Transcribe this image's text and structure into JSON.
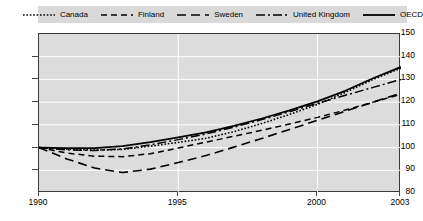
{
  "chart_data": {
    "type": "line",
    "title": "",
    "subtitle": "",
    "xlabel": "",
    "ylabel": "",
    "xlim": [
      1990,
      2003
    ],
    "ylim": [
      80,
      150
    ],
    "yticks": [
      80,
      90,
      100,
      110,
      120,
      130,
      140,
      150
    ],
    "xticks": [
      1990,
      1995,
      2000,
      2003
    ],
    "grid": true,
    "grid_color": "#ffffff",
    "plot_background": "#dcdcdc",
    "legend_position": "top",
    "legend_background": "#d9d9d9",
    "line_color": "#000000",
    "x": [
      1990,
      1991,
      1992,
      1993,
      1994,
      1995,
      1996,
      1997,
      1998,
      1999,
      2000,
      2001,
      2002,
      2003
    ],
    "series": [
      {
        "name": "Canada",
        "dash": "dotted",
        "dash_pattern": "1.6,1.8",
        "width": 1.6,
        "values": [
          100.0,
          99.3,
          98.9,
          99.2,
          100.6,
          102.3,
          104.1,
          107.0,
          110.6,
          114.6,
          119.0,
          124.3,
          130.0,
          135.0
        ]
      },
      {
        "name": "Finland",
        "dash": "short-dash",
        "dash_pattern": "6,4",
        "width": 1.5,
        "values": [
          100.0,
          97.6,
          96.2,
          96.0,
          97.3,
          99.8,
          102.4,
          105.0,
          107.6,
          110.4,
          113.3,
          116.5,
          120.0,
          123.5
        ]
      },
      {
        "name": "Sweden",
        "dash": "long-dash",
        "dash_pattern": "9,5",
        "width": 1.6,
        "values": [
          100.0,
          95.0,
          91.0,
          89.0,
          90.5,
          93.4,
          96.5,
          100.2,
          104.0,
          108.0,
          112.0,
          116.0,
          120.0,
          124.0
        ]
      },
      {
        "name": "United Kingdom",
        "dash": "dash-dot",
        "dash_pattern": "9,3,2,3",
        "width": 1.5,
        "values": [
          100.0,
          99.0,
          98.7,
          99.4,
          101.2,
          103.5,
          106.0,
          109.0,
          112.3,
          115.8,
          119.5,
          123.0,
          126.5,
          130.0
        ]
      },
      {
        "name": "OECD",
        "dash": "solid",
        "dash_pattern": "none",
        "width": 1.8,
        "values": [
          100.0,
          99.8,
          99.8,
          100.6,
          102.4,
          104.5,
          106.7,
          109.6,
          112.8,
          116.4,
          120.3,
          125.0,
          130.5,
          135.5
        ]
      }
    ]
  },
  "legend": {
    "items": [
      {
        "label": "Canada"
      },
      {
        "label": "Finland"
      },
      {
        "label": "Sweden"
      },
      {
        "label": "United Kingdom"
      },
      {
        "label": "OECD"
      }
    ]
  },
  "axes": {
    "y_labels": [
      "150",
      "140",
      "130",
      "120",
      "110",
      "100",
      "90",
      "80"
    ],
    "x_labels": [
      "1990",
      "1995",
      "2000",
      "2003"
    ]
  }
}
